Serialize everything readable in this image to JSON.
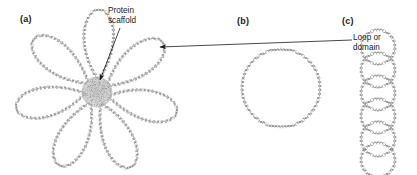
{
  "figure": {
    "background_color": "#ffffff",
    "stroke_color": "#6e6e6e",
    "text_color": "#1a1a1a",
    "scaffold_color": "#9a9a9a",
    "width": 417,
    "height": 175
  },
  "panels": [
    {
      "id": "a",
      "label": "(a)",
      "description": "Rosette of DNA loops anchored to a central protein scaffold",
      "loop_count": 7,
      "center": {
        "x": 97,
        "y": 92
      },
      "scaffold_radius": 15
    },
    {
      "id": "b",
      "label": "(b)",
      "description": "Single large circular DNA loop",
      "loop_count": 1,
      "center": {
        "x": 281,
        "y": 88
      },
      "radius": 39
    },
    {
      "id": "c",
      "label": "(c)",
      "description": "Vertical stack of circular DNA loops",
      "loop_count": 6,
      "center_x": 378,
      "top_y": 30,
      "radius": 17
    }
  ],
  "callouts": [
    {
      "id": "protein-scaffold",
      "line1": "Protein",
      "line2": "scaffold",
      "points_to": "panel-a-center"
    },
    {
      "id": "loop-or-domain",
      "line1": "Loop or",
      "line2": "domain",
      "points_to": "panel-a-loop-tip"
    }
  ]
}
